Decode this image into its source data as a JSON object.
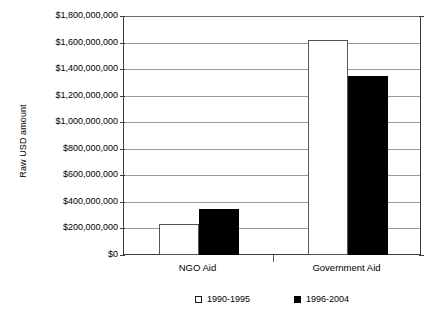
{
  "chart_data": {
    "type": "bar",
    "title": "",
    "xlabel": "",
    "ylabel": "Raw USD amount",
    "categories": [
      "NGO Aid",
      "Government Aid"
    ],
    "series": [
      {
        "name": "1990-1995",
        "values": [
          233000000,
          1620000000
        ],
        "color": "#ffffff"
      },
      {
        "name": "1996-2004",
        "values": [
          346000000,
          1350000000
        ],
        "color": "#000000"
      }
    ],
    "ylim": [
      0,
      1800000000
    ],
    "ytick_values": [
      0,
      200000000,
      400000000,
      600000000,
      800000000,
      1000000000,
      1200000000,
      1400000000,
      1600000000,
      1800000000
    ],
    "ytick_labels": [
      "$0",
      "$200,000,000",
      "$400,000,000",
      "$600,000,000",
      "$800,000,000",
      "$1,000,000,000",
      "$1,200,000,000",
      "$1,400,000,000",
      "$1,600,000,000",
      "$1,800,000,000"
    ],
    "grid": true,
    "legend_position": "bottom"
  }
}
